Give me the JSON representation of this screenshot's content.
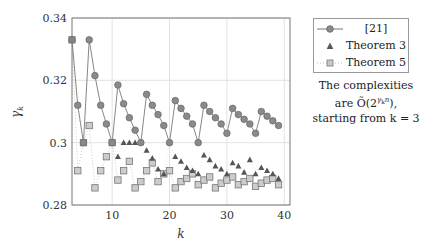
{
  "chart_data": {
    "type": "line",
    "title": "",
    "xlabel": "k",
    "ylabel": "γ_k",
    "xlim": [
      3,
      41
    ],
    "ylim": [
      0.28,
      0.34
    ],
    "xticks": [
      10,
      20,
      30,
      40
    ],
    "yticks": [
      0.28,
      0.3,
      0.32,
      0.34
    ],
    "ytick_labels": [
      "0.28",
      "0.3",
      "0.32",
      "0.34"
    ],
    "xtick_labels": [
      "10",
      "20",
      "30",
      "40"
    ],
    "grid": true,
    "legend_position": "right, outside plot",
    "x": [
      3,
      4,
      5,
      6,
      7,
      8,
      9,
      10,
      11,
      12,
      13,
      14,
      15,
      16,
      17,
      18,
      19,
      20,
      21,
      22,
      23,
      24,
      25,
      26,
      27,
      28,
      29,
      30,
      31,
      32,
      33,
      34,
      35,
      36,
      37,
      38,
      39
    ],
    "series": [
      {
        "name": "[21]",
        "marker": "circle",
        "line": "solid",
        "color": "#8a8a8a",
        "values": [
          0.333,
          0.312,
          0.3,
          0.333,
          0.3215,
          0.312,
          0.306,
          0.3,
          0.3185,
          0.3125,
          0.308,
          0.304,
          0.3,
          0.3155,
          0.312,
          0.309,
          0.3055,
          0.3,
          0.3135,
          0.311,
          0.3085,
          0.306,
          0.3,
          0.312,
          0.31,
          0.308,
          0.306,
          0.303,
          0.311,
          0.309,
          0.3075,
          0.306,
          0.303,
          0.31,
          0.3085,
          0.307,
          0.3055
        ]
      },
      {
        "name": "Theorem 3",
        "marker": "triangle",
        "line": "none",
        "color": "#555555",
        "values": [
          0.333,
          0.312,
          0.3,
          0.333,
          0.3215,
          0.312,
          0.306,
          0.3,
          0.2955,
          0.3,
          0.3,
          0.3,
          0.3,
          0.2975,
          0.295,
          0.2915,
          0.29,
          0.3,
          0.2955,
          0.294,
          0.292,
          0.291,
          0.29,
          0.296,
          0.2945,
          0.2925,
          0.2915,
          0.29,
          0.2935,
          0.2925,
          0.2905,
          0.2945,
          0.29,
          0.292,
          0.291,
          0.29,
          0.2885
        ]
      },
      {
        "name": "Theorem 5",
        "marker": "square",
        "line": "dotted",
        "color": "#b0b0b0",
        "values": [
          0.333,
          0.291,
          0.3,
          0.3055,
          0.2855,
          0.291,
          0.2955,
          0.3,
          0.288,
          0.291,
          0.294,
          0.2855,
          0.2875,
          0.291,
          0.2935,
          0.2875,
          0.29,
          0.291,
          0.2855,
          0.2875,
          0.2885,
          0.29,
          0.2865,
          0.288,
          0.289,
          0.2855,
          0.287,
          0.288,
          0.289,
          0.2865,
          0.2875,
          0.2885,
          0.286,
          0.287,
          0.288,
          0.2885,
          0.2865
        ]
      }
    ],
    "annotations": [
      "The complexities are Õ(2^{γ_k n}), starting from k = 3"
    ]
  },
  "legend": {
    "items": [
      {
        "label": "[21]",
        "marker": "circle"
      },
      {
        "label": "Theorem 3",
        "marker": "triangle"
      },
      {
        "label": "Theorem 5",
        "marker": "square"
      }
    ]
  },
  "note": {
    "line1": "The complexities",
    "line2_prefix": "are ",
    "line2_math": "Õ(2",
    "line2_exp": "γ",
    "line2_exp_sub": "k",
    "line2_exp_n": "n",
    "line2_suffix": "),",
    "line3": "starting from k = 3"
  },
  "axes": {
    "xlabel": "k",
    "ylabel_main": "γ",
    "ylabel_sub": "k"
  }
}
